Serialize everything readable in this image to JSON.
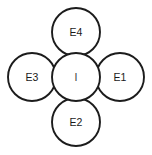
{
  "diagram": {
    "type": "node-cluster",
    "title": "",
    "background_color": "#ffffff",
    "stroke_color": "#1c1c1c",
    "fill_color": "#ffffff",
    "label_color": "#1a1a1a",
    "center": {
      "id": "center",
      "label": "I",
      "cx": 76,
      "cy": 77,
      "r": 24
    },
    "satellites": [
      {
        "id": "top",
        "label": "E4",
        "position": "top",
        "cx": 76,
        "cy": 32,
        "r": 24
      },
      {
        "id": "right",
        "label": "E1",
        "position": "right",
        "cx": 120,
        "cy": 77,
        "r": 24
      },
      {
        "id": "bottom",
        "label": "E2",
        "position": "bottom",
        "cx": 76,
        "cy": 122,
        "r": 24
      },
      {
        "id": "left",
        "label": "E3",
        "position": "left",
        "cx": 32,
        "cy": 77,
        "r": 24
      }
    ]
  }
}
